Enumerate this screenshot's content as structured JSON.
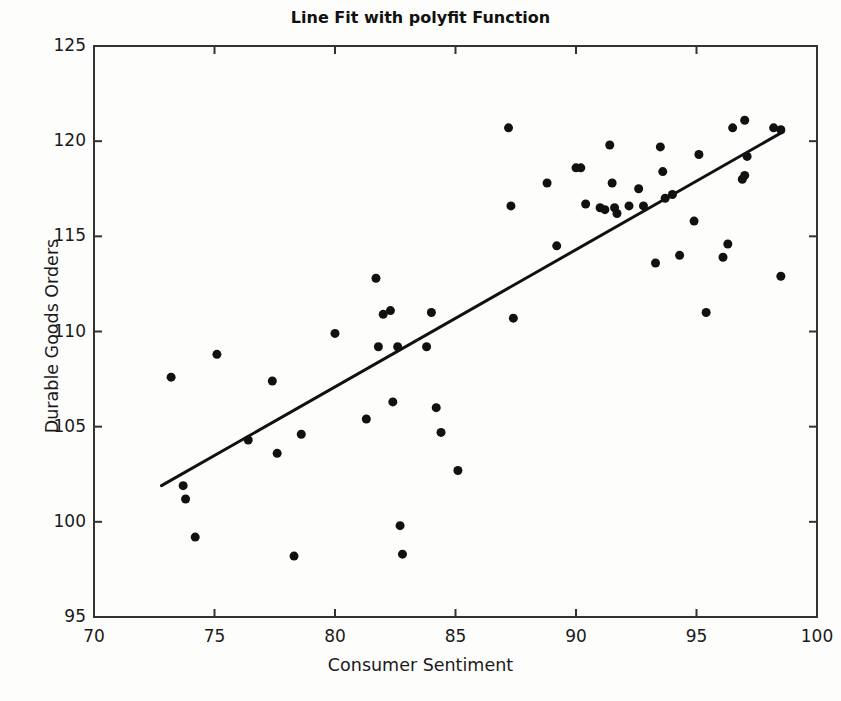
{
  "chart_data": {
    "type": "scatter",
    "title": "Line Fit with polyfit Function",
    "xlabel": "Consumer Sentiment",
    "ylabel": "Durable Goods Orders",
    "xlim": [
      70,
      100
    ],
    "ylim": [
      95,
      125
    ],
    "xticks": [
      70,
      75,
      80,
      85,
      90,
      95,
      100
    ],
    "yticks": [
      95,
      100,
      105,
      110,
      115,
      120,
      125
    ],
    "grid": false,
    "legend": null,
    "marker": {
      "shape": "circle",
      "color": "#111111",
      "size": 9
    },
    "series": [
      {
        "name": "Observations",
        "type": "scatter",
        "points": [
          [
            73.2,
            107.6
          ],
          [
            73.7,
            101.9
          ],
          [
            73.8,
            101.2
          ],
          [
            74.2,
            99.2
          ],
          [
            75.1,
            108.8
          ],
          [
            76.4,
            104.3
          ],
          [
            77.4,
            107.4
          ],
          [
            77.6,
            103.6
          ],
          [
            78.3,
            98.2
          ],
          [
            78.6,
            104.6
          ],
          [
            80.0,
            109.9
          ],
          [
            81.3,
            105.4
          ],
          [
            81.7,
            112.8
          ],
          [
            81.8,
            109.2
          ],
          [
            82.0,
            110.9
          ],
          [
            82.3,
            111.1
          ],
          [
            82.4,
            106.3
          ],
          [
            82.6,
            109.2
          ],
          [
            82.7,
            99.8
          ],
          [
            82.8,
            98.3
          ],
          [
            83.8,
            109.2
          ],
          [
            84.0,
            111.0
          ],
          [
            84.2,
            106.0
          ],
          [
            84.4,
            104.7
          ],
          [
            85.1,
            102.7
          ],
          [
            87.2,
            120.7
          ],
          [
            87.3,
            116.6
          ],
          [
            87.4,
            110.7
          ],
          [
            88.8,
            117.8
          ],
          [
            89.2,
            114.5
          ],
          [
            90.0,
            118.6
          ],
          [
            90.2,
            118.6
          ],
          [
            90.4,
            116.7
          ],
          [
            91.0,
            116.5
          ],
          [
            91.2,
            116.4
          ],
          [
            91.4,
            119.8
          ],
          [
            91.5,
            117.8
          ],
          [
            91.6,
            116.5
          ],
          [
            91.7,
            116.2
          ],
          [
            92.2,
            116.6
          ],
          [
            92.6,
            117.5
          ],
          [
            92.8,
            116.6
          ],
          [
            93.3,
            113.6
          ],
          [
            93.5,
            119.7
          ],
          [
            93.6,
            118.4
          ],
          [
            93.7,
            117.0
          ],
          [
            94.0,
            117.2
          ],
          [
            94.3,
            114.0
          ],
          [
            94.9,
            115.8
          ],
          [
            95.1,
            119.3
          ],
          [
            95.4,
            111.0
          ],
          [
            96.1,
            113.9
          ],
          [
            96.3,
            114.6
          ],
          [
            96.5,
            120.7
          ],
          [
            96.9,
            118.0
          ],
          [
            97.0,
            118.2
          ],
          [
            97.0,
            121.1
          ],
          [
            97.1,
            119.2
          ],
          [
            98.2,
            120.7
          ],
          [
            98.5,
            120.6
          ],
          [
            98.5,
            112.9
          ]
        ]
      },
      {
        "name": "polyfit line",
        "type": "line",
        "color": "#111111",
        "width": 3,
        "points": [
          [
            72.8,
            101.9
          ],
          [
            98.6,
            120.5
          ]
        ]
      }
    ]
  },
  "figure": {
    "background": "#fdfdfc",
    "axes_color": "#333333",
    "plot_box": {
      "left": 94,
      "top": 46,
      "right": 817,
      "bottom": 617
    }
  }
}
